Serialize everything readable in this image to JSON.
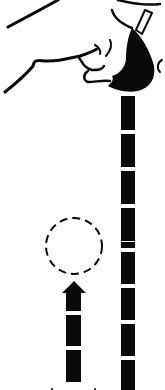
{
  "figure": {
    "colors": {
      "ink": "#0a0a0a",
      "background": "#ffffff"
    }
  },
  "elements": {
    "hand": {
      "label": "hand pressing down"
    },
    "right_dashes": {
      "label": "downward dashed path",
      "x": 121,
      "width": 14,
      "start_y": 96,
      "segment_height": 33,
      "gap": 4,
      "count": 8
    },
    "target_circle": {
      "label": "dashed circle target",
      "cx": 74,
      "cy": 246,
      "r": 28
    },
    "up_arrow": {
      "label": "upward arrow",
      "x": 66,
      "width": 15,
      "head_top": 290
    }
  }
}
